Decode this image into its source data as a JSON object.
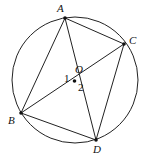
{
  "diagram": {
    "circle": {
      "cx": 75,
      "cy": 80,
      "r": 63
    },
    "points": {
      "A": {
        "label": "A",
        "x": 65,
        "y": 18
      },
      "B": {
        "label": "B",
        "x": 21,
        "y": 113
      },
      "C": {
        "label": "C",
        "x": 124,
        "y": 44
      },
      "D": {
        "label": "D",
        "x": 96,
        "y": 140
      },
      "O": {
        "label": "O",
        "x": 74.5,
        "y": 81
      }
    },
    "angle_labels": {
      "one": "1",
      "two": "2"
    },
    "segments": [
      "AB",
      "AC",
      "AD",
      "BC",
      "BD",
      "CD"
    ],
    "stroke_color": "#222222"
  }
}
